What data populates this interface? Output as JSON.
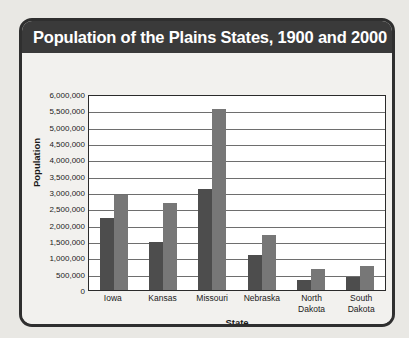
{
  "chart_data": {
    "type": "bar",
    "title": "Population of the Plains States, 1900 and 2000",
    "xlabel": "State",
    "ylabel": "Population",
    "categories": [
      "Iowa",
      "Kansas",
      "Missouri",
      "Nebraska",
      "North Dakota",
      "South Dakota"
    ],
    "category_lines": [
      [
        "Iowa"
      ],
      [
        "Kansas"
      ],
      [
        "Missouri"
      ],
      [
        "Nebraska"
      ],
      [
        "North",
        "Dakota"
      ],
      [
        "South",
        "Dakota"
      ]
    ],
    "series": [
      {
        "name": "Population, 1900",
        "color": "#4d4d4d",
        "values": [
          2230000,
          1470000,
          3110000,
          1070000,
          320000,
          400000
        ]
      },
      {
        "name": "Population, 2000",
        "color": "#777777",
        "values": [
          2930000,
          2690000,
          5600000,
          1710000,
          640000,
          755000
        ]
      }
    ],
    "ylim": [
      0,
      6000000
    ],
    "ytick_values": [
      0,
      500000,
      1000000,
      1500000,
      2000000,
      2500000,
      3000000,
      3500000,
      4000000,
      4500000,
      5000000,
      5500000,
      6000000
    ],
    "ytick_labels": [
      "0",
      "500,000",
      "1,000,000",
      "1,500,000",
      "2,000,000",
      "2,500,000",
      "3,000,000",
      "3,500,000",
      "4,000,000",
      "4,500,000",
      "5,000,000",
      "5,500,000",
      "6,000,000"
    ],
    "grid": true,
    "legend_position": "bottom-left"
  },
  "theme": {
    "frame_color": "#2f2f2f",
    "title_bar_color": "#3a3a3a",
    "title_text_color": "#ffffff",
    "page_background": "#e9e8e4",
    "card_background": "#f2f1ee",
    "plot_background": "#ffffff",
    "gridline_color": "#6e6e6e"
  }
}
